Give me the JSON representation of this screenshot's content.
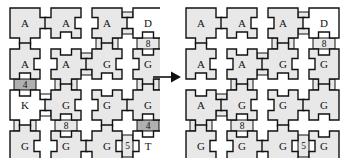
{
  "figure": {
    "type": "tile-puzzle-transformation",
    "arrow": {
      "name": "right-arrow",
      "glyph": "→"
    },
    "palette": {
      "tile_fill": "#e8e8e8",
      "tile_white": "#ffffff",
      "tile_dark": "#b0b0b0",
      "stroke": "#111111",
      "connector_stroke": "#777777",
      "background": "#ffffff"
    }
  },
  "grids": [
    {
      "name": "grid-left",
      "rows": [
        [
          {
            "label": "A",
            "fill": "tile_fill"
          },
          {
            "label": "A",
            "fill": "tile_fill"
          },
          {
            "label": "A",
            "fill": "tile_fill"
          },
          {
            "label": "D",
            "fill": "tile_white"
          }
        ],
        [
          {
            "label": "A",
            "fill": "tile_fill"
          },
          {
            "label": "A",
            "fill": "tile_fill"
          },
          {
            "label": "G",
            "fill": "tile_fill"
          },
          {
            "label": "G",
            "fill": "tile_fill"
          }
        ],
        [
          {
            "label": "K",
            "fill": "tile_white"
          },
          {
            "label": "G",
            "fill": "tile_fill"
          },
          {
            "label": "G",
            "fill": "tile_fill"
          },
          {
            "label": "G",
            "fill": "tile_fill"
          }
        ],
        [
          {
            "label": "G",
            "fill": "tile_fill"
          },
          {
            "label": "G",
            "fill": "tile_fill"
          },
          {
            "label": "G",
            "fill": "tile_fill"
          },
          {
            "label": "T",
            "fill": "tile_white"
          }
        ]
      ],
      "h_connectors": [
        {
          "row": 0,
          "after_col": 2,
          "label": "5",
          "fill": "tile_fill"
        },
        {
          "row": 1,
          "after_col": 1,
          "label": "5",
          "fill": "tile_fill"
        },
        {
          "row": 2,
          "after_col": 0,
          "label": "5",
          "fill": "tile_white"
        },
        {
          "row": 3,
          "after_col": 2,
          "label": "5",
          "fill": "tile_fill"
        }
      ],
      "v_connectors": [
        {
          "col": 2,
          "after_row": 0,
          "label": "6",
          "fill": "tile_fill"
        },
        {
          "col": 3,
          "after_row": 0,
          "label": "8",
          "fill": "tile_fill"
        },
        {
          "col": 0,
          "after_row": 1,
          "label": "4",
          "fill": "tile_dark"
        },
        {
          "col": 1,
          "after_row": 1,
          "label": "6",
          "fill": "tile_fill"
        },
        {
          "col": 3,
          "after_row": 1,
          "label": "8",
          "fill": "tile_fill"
        },
        {
          "col": 0,
          "after_row": 2,
          "label": "6",
          "fill": "tile_fill"
        },
        {
          "col": 1,
          "after_row": 2,
          "label": "8",
          "fill": "tile_fill"
        },
        {
          "col": 3,
          "after_row": 2,
          "label": "4",
          "fill": "tile_dark"
        }
      ]
    },
    {
      "name": "grid-right",
      "rows": [
        [
          {
            "label": "A",
            "fill": "tile_fill"
          },
          {
            "label": "A",
            "fill": "tile_fill"
          },
          {
            "label": "A",
            "fill": "tile_fill"
          },
          {
            "label": "D",
            "fill": "tile_white"
          }
        ],
        [
          {
            "label": "A",
            "fill": "tile_fill"
          },
          {
            "label": "A",
            "fill": "tile_fill"
          },
          {
            "label": "G",
            "fill": "tile_fill"
          },
          {
            "label": "G",
            "fill": "tile_fill"
          }
        ],
        [
          {
            "label": "A",
            "fill": "tile_fill"
          },
          {
            "label": "G",
            "fill": "tile_fill"
          },
          {
            "label": "G",
            "fill": "tile_fill"
          },
          {
            "label": "G",
            "fill": "tile_fill"
          }
        ],
        [
          {
            "label": "G",
            "fill": "tile_fill"
          },
          {
            "label": "G",
            "fill": "tile_fill"
          },
          {
            "label": "G",
            "fill": "tile_fill"
          },
          {
            "label": "G",
            "fill": "tile_fill"
          }
        ]
      ],
      "h_connectors": [
        {
          "row": 0,
          "after_col": 2,
          "label": "5",
          "fill": "tile_fill"
        },
        {
          "row": 1,
          "after_col": 1,
          "label": "5",
          "fill": "tile_fill"
        },
        {
          "row": 2,
          "after_col": 0,
          "label": "5",
          "fill": "tile_fill"
        },
        {
          "row": 3,
          "after_col": 2,
          "label": "5",
          "fill": "tile_fill"
        }
      ],
      "v_connectors": [
        {
          "col": 2,
          "after_row": 0,
          "label": "6",
          "fill": "tile_fill"
        },
        {
          "col": 3,
          "after_row": 0,
          "label": "8",
          "fill": "tile_fill"
        },
        {
          "col": 1,
          "after_row": 1,
          "label": "6",
          "fill": "tile_fill"
        },
        {
          "col": 3,
          "after_row": 1,
          "label": "8",
          "fill": "tile_fill"
        },
        {
          "col": 0,
          "after_row": 2,
          "label": "6",
          "fill": "tile_fill"
        },
        {
          "col": 1,
          "after_row": 2,
          "label": "8",
          "fill": "tile_fill"
        }
      ]
    }
  ]
}
